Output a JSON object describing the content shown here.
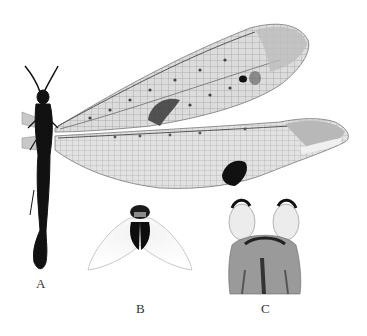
{
  "figure": {
    "panels": [
      {
        "label": "A",
        "content": "habitus-dorsal-wings-spread"
      },
      {
        "label": "B",
        "content": "genitalic-structure-ventral"
      },
      {
        "label": "C",
        "content": "genitalic-structure-dorsal"
      }
    ],
    "colors": {
      "background": "#ffffff",
      "wing_membrane": "#d9d9d9",
      "wing_venation": "#8a8a8a",
      "wing_spot": "#1a1a1a",
      "body": "#111111",
      "label": "#333333"
    }
  }
}
